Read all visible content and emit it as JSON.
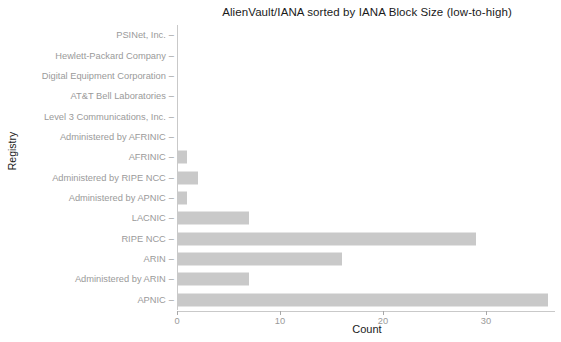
{
  "chart_data": {
    "type": "bar",
    "orientation": "horizontal",
    "title": "AlienVault/IANA sorted by IANA Block Size (low-to-high)",
    "xlabel": "Count",
    "ylabel": "Registry",
    "grid": false,
    "legend": null,
    "xlim": [
      0,
      36.7
    ],
    "xticks": [
      0,
      10,
      20,
      30
    ],
    "xtick_labels": [
      "0",
      "10",
      "20",
      "30"
    ],
    "bar_color": "#c9c9c9",
    "categories": [
      "PSINet, Inc.",
      "Hewlett-Packard Company",
      "Digital Equipment Corporation",
      "AT&T Bell Laboratories",
      "Level 3 Communications, Inc.",
      "Administered by AFRINIC",
      "AFRINIC",
      "Administered by RIPE NCC",
      "Administered by APNIC",
      "LACNIC",
      "RIPE NCC",
      "ARIN",
      "Administered by ARIN",
      "APNIC"
    ],
    "values": [
      0,
      0,
      0,
      0,
      0,
      0,
      1,
      2,
      1,
      7,
      29,
      16,
      7,
      36
    ]
  },
  "axis": {
    "y_title": "Registry",
    "x_title": "Count",
    "tick_dash": "–"
  }
}
